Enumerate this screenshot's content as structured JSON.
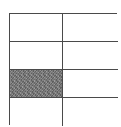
{
  "diagram": {
    "type": "grid",
    "rows": 4,
    "columns": 2,
    "shaded_cells": [
      {
        "row": 3,
        "column": 1
      }
    ],
    "colors": {
      "line": "#4a4a4a",
      "fill": "#ffffff",
      "shaded": "#7a7a7a"
    }
  }
}
